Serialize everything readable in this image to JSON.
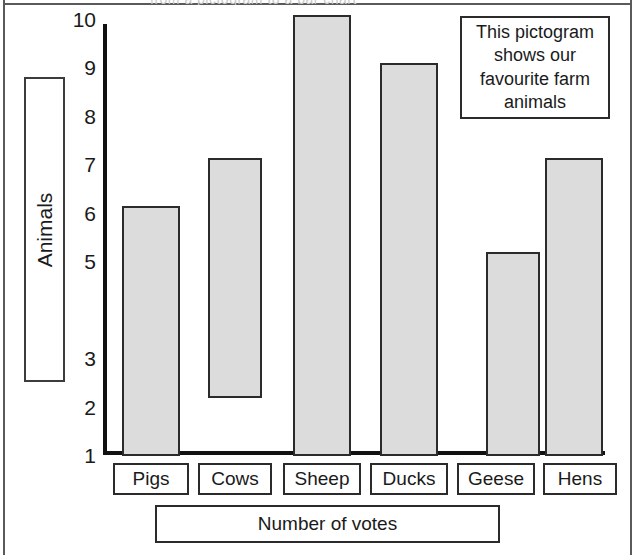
{
  "frame": {
    "top_fragment_text": "from a pictogram to a bar chart"
  },
  "note": {
    "text": "This pictogram shows our favourite farm animals"
  },
  "axes": {
    "y_title": "Animals",
    "x_title": "Number of votes",
    "y_tick_labels": [
      "10",
      "9",
      "8",
      "7",
      "6",
      "5",
      "3",
      "2",
      "1"
    ]
  },
  "chart_data": {
    "type": "bar",
    "title": "This pictogram shows our favourite farm animals",
    "xlabel": "Number of votes",
    "ylabel": "Animals",
    "categories": [
      "Pigs",
      "Cows",
      "Sheep",
      "Ducks",
      "Geese",
      "Hens"
    ],
    "values": [
      6.15,
      7.15,
      10.1,
      9.1,
      5.2,
      7.15
    ],
    "bar_bases": [
      1.0,
      2.2,
      1.0,
      1.0,
      1.0,
      1.0
    ],
    "y_tick_values": [
      10,
      9,
      8,
      7,
      6,
      5,
      3,
      2,
      1
    ],
    "y_axis_anomaly": "tick value 4 is missing from the scale",
    "ylim": [
      1,
      10.4
    ],
    "grid": false,
    "legend": false,
    "bar_fill_color": "#dcdcdc",
    "bar_border_color": "#2b2b2b",
    "axis_color": "#111111"
  },
  "series_cells": [
    {
      "label": "Pigs",
      "value": "6.15",
      "base": "1.0"
    },
    {
      "label": "Cows",
      "value": "7.15",
      "base": "2.2"
    },
    {
      "label": "Sheep",
      "value": "10.1",
      "base": "1.0"
    },
    {
      "label": "Ducks",
      "value": "9.1",
      "base": "1.0"
    },
    {
      "label": "Geese",
      "value": "5.2",
      "base": "1.0"
    },
    {
      "label": "Hens",
      "value": "7.15",
      "base": "1.0"
    }
  ]
}
